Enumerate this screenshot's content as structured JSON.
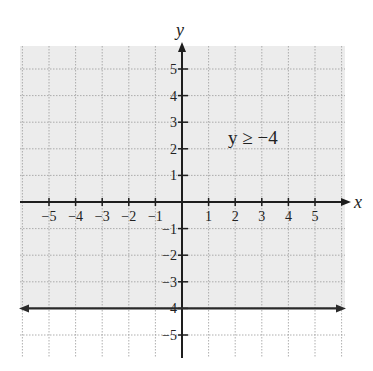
{
  "chart_data": {
    "type": "inequality-graph",
    "title": "",
    "inequality_label": "y ≥ −4",
    "xlabel": "x",
    "ylabel": "y",
    "xlim": [
      -6,
      6
    ],
    "ylim": [
      -6,
      6
    ],
    "x_ticks": [
      "−5",
      "−4",
      "−3",
      "−2",
      "−1",
      "1",
      "2",
      "3",
      "4",
      "5"
    ],
    "y_ticks": [
      "5",
      "4",
      "3",
      "2",
      "1",
      "−1",
      "−2",
      "−3",
      "−4",
      "−5"
    ],
    "grid": true,
    "boundary_line": {
      "equation": "y = -4",
      "style": "solid"
    },
    "shaded_region": "above",
    "colors": {
      "shade": "#ececec",
      "grid": "#9a9a9a",
      "axis": "#1e1e1e",
      "line": "#2a2a2a"
    }
  }
}
